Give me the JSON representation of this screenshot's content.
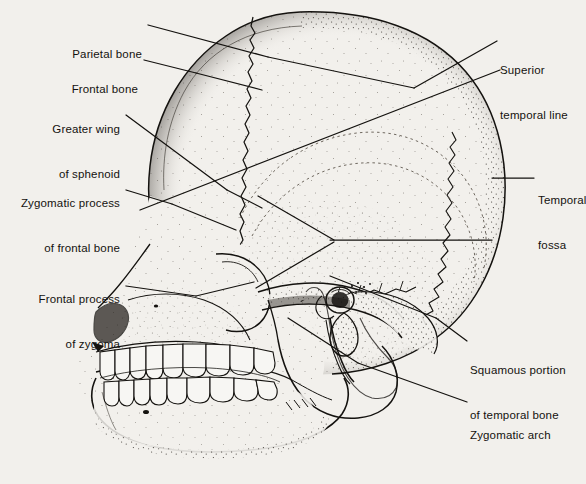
{
  "figure": {
    "style": "stippled line drawing",
    "background_color": "#f2f0ec",
    "ink_color": "#14120f",
    "width": 586,
    "height": 484
  },
  "labels": [
    {
      "id": "parietal-bone",
      "text": "Parietal bone",
      "lines": [
        "Parietal bone"
      ],
      "align": "right",
      "text_x": 142,
      "text_y": 17,
      "leader": [
        [
          148,
          25
        ],
        [
          268,
          57
        ]
      ]
    },
    {
      "id": "frontal-bone",
      "text": "Frontal bone",
      "lines": [
        "Frontal bone"
      ],
      "align": "right",
      "text_x": 138,
      "text_y": 52,
      "leader": [
        [
          144,
          60
        ],
        [
          196,
          73
        ]
      ]
    },
    {
      "id": "greater-wing-of-sphenoid",
      "text": "Greater wing of sphenoid",
      "lines": [
        "Greater wing",
        "of sphenoid"
      ],
      "align": "right",
      "text_x": 120,
      "text_y": 92,
      "leader": [
        [
          126,
          115
        ],
        [
          227,
          190
        ]
      ]
    },
    {
      "id": "zygomatic-process-of-frontal-bone",
      "text": "Zygomatic process of frontal bone",
      "lines": [
        "Zygomatic process",
        "of frontal bone"
      ],
      "align": "right",
      "text_x": 120,
      "text_y": 166,
      "leader": [
        [
          126,
          190
        ],
        [
          172,
          204
        ]
      ]
    },
    {
      "id": "frontal-process-of-zygoma",
      "text": "Frontal process of zygoma",
      "lines": [
        "Frontal process",
        "of zygoma"
      ],
      "align": "right",
      "text_x": 120,
      "text_y": 262,
      "leader": [
        [
          126,
          286
        ],
        [
          196,
          296
        ]
      ]
    },
    {
      "id": "superior-temporal-line",
      "text": "Superior temporal line",
      "lines": [
        "Superior",
        "temporal line"
      ],
      "align": "left",
      "text_x": 500,
      "text_y": 33,
      "leader": [
        [
          497,
          41
        ],
        [
          414,
          88
        ]
      ]
    },
    {
      "id": "temporal-fossa",
      "text": "Temporal fossa",
      "lines": [
        "Temporal",
        "fossa"
      ],
      "align": "left",
      "text_x": 538,
      "text_y": 163,
      "leader": [
        [
          534,
          178
        ],
        [
          492,
          178
        ]
      ]
    },
    {
      "id": "squamous-portion-of-temporal-bone",
      "text": "Squamous portion of temporal bone",
      "lines": [
        "Squamous portion",
        "of temporal bone"
      ],
      "align": "left",
      "text_x": 470,
      "text_y": 333,
      "leader": [
        [
          467,
          341
        ],
        [
          436,
          318
        ]
      ]
    },
    {
      "id": "zygomatic-arch",
      "text": "Zygomatic arch",
      "lines": [
        "Zygomatic arch"
      ],
      "align": "left",
      "text_x": 470,
      "text_y": 398,
      "leader": [
        [
          467,
          402
        ],
        [
          358,
          363
        ]
      ]
    }
  ],
  "anatomy_parts": [
    "cranial vault",
    "frontal bone",
    "parietal bone",
    "occipital bone",
    "coronal suture",
    "lambdoid suture",
    "temporal fossa",
    "greater wing of sphenoid",
    "orbit",
    "nasal aperture",
    "zygomatic bone",
    "zygomatic arch",
    "maxilla",
    "mandible",
    "upper teeth",
    "lower teeth",
    "external auditory meatus",
    "mastoid process",
    "styloid process",
    "condylar process",
    "coronoid process"
  ]
}
